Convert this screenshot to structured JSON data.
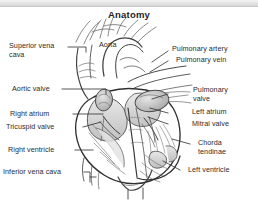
{
  "figure": {
    "title": "Anatomy",
    "width": 258,
    "height": 201,
    "background_color": "#ffffff",
    "text_color": "#2b2b2b",
    "line_color": "#4a4a4a",
    "shade_color": "#c9c9c9",
    "style": "grayscale pencil line drawing of a human heart, cutaway/cross-section view with labeled parts"
  },
  "labels": {
    "superior_vena_cava": "Superior vena\ncava",
    "aortic_valve": "Aortic valve",
    "aorta": "Aorta",
    "pulmonary_artery": "Pulmonary artery",
    "pulmonary_vein": "Pulmonary vein",
    "pulmonary_valve": "Pulmonary\nvalve",
    "left_atrium": "Left atrium",
    "mitral_valve": "Mitral valve",
    "right_atrium": "Right atrium",
    "tricuspid_valve": "Tricuspid valve",
    "chorda_tendinae": "Chorda\ntendinae",
    "right_ventricle": "Right ventricle",
    "inferior_vena_cava": "Inferior vena cava",
    "left_ventricle": "Left ventricle"
  }
}
